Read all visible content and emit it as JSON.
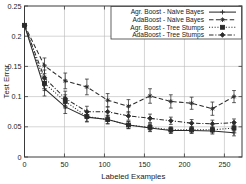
{
  "chart_data": {
    "type": "line",
    "title": "",
    "xlabel": "Labeled Examples",
    "ylabel": "Test Error",
    "xlim": [
      0,
      272
    ],
    "ylim": [
      0,
      0.25
    ],
    "xticks": [
      0,
      50,
      100,
      150,
      200,
      250
    ],
    "xticklabels": [
      "0",
      "50",
      "100",
      "150",
      "200",
      "250"
    ],
    "yticks": [
      0,
      0.05,
      0.1,
      0.15,
      0.2,
      0.25
    ],
    "yticklabels": [
      "0",
      "0.05",
      "0.1",
      "0.15",
      "0.2",
      "0.25"
    ],
    "grid": true,
    "grid_axis": "both",
    "legend_position": "upper right",
    "error_bars": true,
    "x": [
      0,
      25,
      51,
      78,
      104,
      130,
      157,
      183,
      209,
      235,
      262
    ],
    "series": [
      {
        "name": "Agr. Boost - Naive Bayes",
        "marker": "plus",
        "linestyle": "solid",
        "values": [
          0.218,
          0.113,
          0.083,
          0.066,
          0.062,
          0.053,
          0.048,
          0.044,
          0.044,
          0.043,
          0.04
        ],
        "errors": [
          0.004,
          0.012,
          0.011,
          0.008,
          0.007,
          0.006,
          0.006,
          0.005,
          0.005,
          0.005,
          0.005
        ]
      },
      {
        "name": "AdaBoost - Naive Bayes",
        "marker": "asterisk",
        "linestyle": "dashed",
        "values": [
          0.218,
          0.151,
          0.126,
          0.116,
          0.094,
          0.084,
          0.101,
          0.092,
          0.089,
          0.08,
          0.1
        ],
        "errors": [
          0.004,
          0.013,
          0.013,
          0.013,
          0.011,
          0.011,
          0.012,
          0.011,
          0.01,
          0.011,
          0.01
        ]
      },
      {
        "name": "Agr. Boost - Tree Stumps",
        "marker": "square",
        "linestyle": "dotted",
        "values": [
          0.218,
          0.122,
          0.092,
          0.067,
          0.062,
          0.053,
          0.049,
          0.045,
          0.045,
          0.045,
          0.048
        ],
        "errors": [
          0.004,
          0.012,
          0.011,
          0.008,
          0.007,
          0.006,
          0.006,
          0.005,
          0.005,
          0.005,
          0.005
        ]
      },
      {
        "name": "AdaBoost - Tree Stumps",
        "marker": "diamond",
        "linestyle": "dashdot",
        "values": [
          0.218,
          0.131,
          0.097,
          0.075,
          0.075,
          0.068,
          0.064,
          0.06,
          0.056,
          0.055,
          0.057
        ],
        "errors": [
          0.004,
          0.013,
          0.012,
          0.009,
          0.008,
          0.007,
          0.007,
          0.006,
          0.006,
          0.006,
          0.006
        ]
      }
    ],
    "legend_entries": [
      "Agr. Boost - Naive Bayes",
      "AdaBoost - Naive Bayes",
      "Agr. Boost - Tree Stumps",
      "AdaBoost - Tree Stumps"
    ]
  }
}
